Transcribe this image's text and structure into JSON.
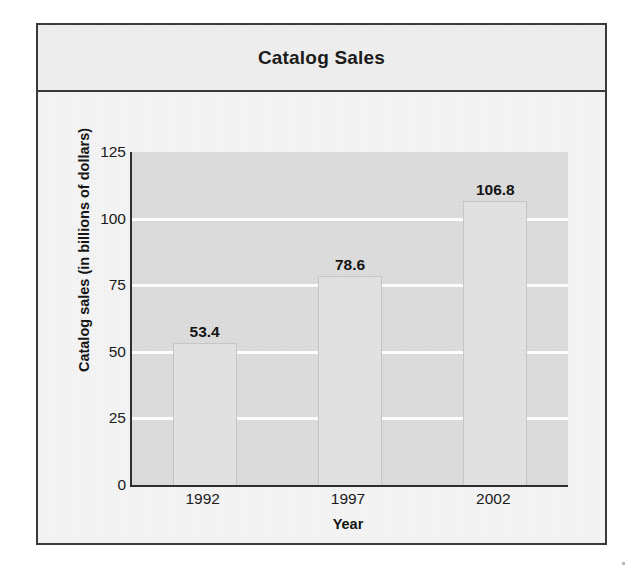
{
  "figure": {
    "title": "Catalog Sales"
  },
  "chart_data": {
    "type": "bar",
    "title": "Catalog Sales",
    "categories": [
      "1992",
      "1997",
      "2002"
    ],
    "values": [
      53.4,
      78.6,
      106.8
    ],
    "value_labels": [
      "53.4",
      "78.6",
      "106.8"
    ],
    "xlabel": "Year",
    "ylabel": "Catalog sales (in billions of dollars)",
    "ylim": [
      0,
      125
    ],
    "ytick_labels": [
      "0",
      "25",
      "50",
      "75",
      "100",
      "125"
    ],
    "ytick_values": [
      0,
      25,
      50,
      75,
      100,
      125
    ],
    "grid": "horizontal-white-gridlines",
    "legend": "none",
    "colors": {
      "bar_fill": "#e2e2e2",
      "plot_background": "#dcdcdc",
      "gridline": "#ffffff",
      "axis": "#2e2e2e",
      "frame_border": "#3a3a3a",
      "text": "#1b1b1b"
    }
  }
}
